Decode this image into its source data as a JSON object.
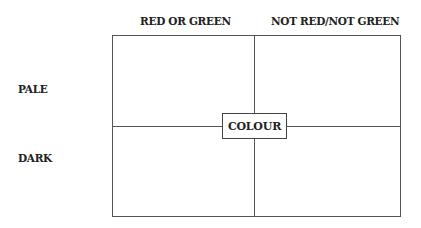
{
  "diagram": {
    "columns": [
      "RED OR GREEN",
      "NOT RED/NOT GREEN"
    ],
    "rows": [
      "PALE",
      "DARK"
    ],
    "center_label": "COLOUR",
    "line_color": "#555555",
    "text_color": "#222222"
  }
}
